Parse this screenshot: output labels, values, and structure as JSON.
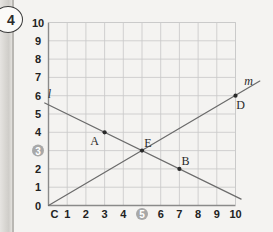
{
  "exercise": {
    "number": "4"
  },
  "chart_data": {
    "type": "line",
    "title": "",
    "xlabel": "",
    "ylabel": "",
    "xlim": [
      0,
      10
    ],
    "ylim": [
      0,
      10
    ],
    "grid": true,
    "legend": "none",
    "x_ticks": [
      "C",
      "1",
      "2",
      "3",
      "4",
      "5",
      "6",
      "7",
      "8",
      "9",
      "10"
    ],
    "y_ticks": [
      "0",
      "1",
      "2",
      "3",
      "4",
      "5",
      "6",
      "7",
      "8",
      "9",
      "10"
    ],
    "highlighted_x_tick": "5",
    "highlighted_y_tick": "3",
    "series": [
      {
        "name": "l",
        "label": "l",
        "slope": -0.5,
        "intercept": 5.5,
        "draw_from": [
          -0.2,
          5.6
        ],
        "draw_to": [
          10.3,
          0.35
        ],
        "points": [
          {
            "name": "A",
            "x": 3,
            "y": 4
          },
          {
            "name": "E",
            "x": 5,
            "y": 3
          },
          {
            "name": "B",
            "x": 7,
            "y": 2
          }
        ]
      },
      {
        "name": "m",
        "label": "m",
        "slope": 0.6,
        "intercept": 0,
        "draw_from": [
          0,
          0
        ],
        "draw_to": [
          11.3,
          6.8
        ],
        "points": [
          {
            "name": "C",
            "x": 0,
            "y": 0
          },
          {
            "name": "E",
            "x": 5,
            "y": 3
          },
          {
            "name": "D",
            "x": 10,
            "y": 6
          }
        ]
      }
    ],
    "labeled_points": [
      {
        "name": "A",
        "x": 3,
        "y": 4,
        "label": "A",
        "label_pos": "below-left"
      },
      {
        "name": "B",
        "x": 7,
        "y": 2,
        "label": "B",
        "label_pos": "above-right"
      },
      {
        "name": "D",
        "x": 10,
        "y": 6,
        "label": "D",
        "label_pos": "below-right"
      },
      {
        "name": "E",
        "x": 5,
        "y": 3,
        "label": "E",
        "label_pos": "above-right"
      },
      {
        "name": "C",
        "x": 0,
        "y": 0,
        "label": "C",
        "label_pos": "below-right"
      }
    ],
    "line_labels": [
      {
        "text": "l",
        "x": 0.05,
        "y": 5.9
      },
      {
        "text": "m",
        "x": 10.7,
        "y": 6.6
      }
    ],
    "colors": {
      "grid": "#c9c9c9",
      "axis": "#8a8a8a",
      "line": "#6b6b6b",
      "point": "#2a2a2a",
      "highlight": "#a8a8a8",
      "text": "#222222",
      "background": "#f4f3f1"
    }
  }
}
